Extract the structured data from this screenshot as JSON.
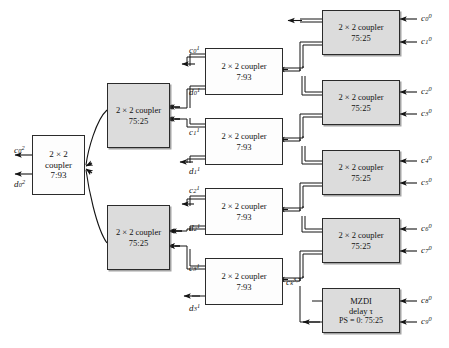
{
  "diagram": {
    "colors": {
      "shaded_fill": "#dcdcdc",
      "plain_fill": "#fdfdfd",
      "stroke": "#2b2b2b",
      "text": "#111111"
    },
    "stage": {
      "width": 449,
      "height": 348
    }
  },
  "blocks": {
    "output_coupler": {
      "name": "output-coupler",
      "line1": "2 × 2",
      "line2": "coupler",
      "line3": "7:93",
      "style": "plain"
    },
    "stage2_couplers": [
      {
        "name": "stage2-coupler-top",
        "line1": "2 × 2 coupler",
        "line2": "75:25",
        "style": "shaded"
      },
      {
        "name": "stage2-coupler-bottom",
        "line1": "2 × 2 coupler",
        "line2": "75:25",
        "style": "shaded"
      }
    ],
    "stage1_couplers": [
      {
        "name": "stage1-coupler-0",
        "line1": "2 × 2 coupler",
        "line2": "7:93",
        "style": "plain"
      },
      {
        "name": "stage1-coupler-1",
        "line1": "2 × 2 coupler",
        "line2": "7:93",
        "style": "plain"
      },
      {
        "name": "stage1-coupler-2",
        "line1": "2 × 2 coupler",
        "line2": "7:93",
        "style": "plain"
      },
      {
        "name": "stage1-coupler-3",
        "line1": "2 × 2 coupler",
        "line2": "7:93",
        "style": "plain"
      }
    ],
    "input_couplers": [
      {
        "name": "input-coupler-0",
        "line1": "2 × 2 coupler",
        "line2": "75:25",
        "style": "shaded"
      },
      {
        "name": "input-coupler-1",
        "line1": "2 × 2 coupler",
        "line2": "75:25",
        "style": "shaded"
      },
      {
        "name": "input-coupler-2",
        "line1": "2 × 2 coupler",
        "line2": "75:25",
        "style": "shaded"
      },
      {
        "name": "input-coupler-3",
        "line1": "2 × 2 coupler",
        "line2": "75:25",
        "style": "shaded"
      }
    ],
    "mzdi": {
      "name": "mzdi-block",
      "line1": "MZDI",
      "line2": "delay τ",
      "line3": "PS = 0: 75:25",
      "style": "shaded"
    }
  },
  "labels": {
    "inputs": [
      {
        "base": "c",
        "sub": "0",
        "sup": "0"
      },
      {
        "base": "c",
        "sub": "1",
        "sup": "0"
      },
      {
        "base": "c",
        "sub": "2",
        "sup": "0"
      },
      {
        "base": "c",
        "sub": "3",
        "sup": "0"
      },
      {
        "base": "c",
        "sub": "4",
        "sup": "0"
      },
      {
        "base": "c",
        "sub": "5",
        "sup": "0"
      },
      {
        "base": "c",
        "sub": "6",
        "sup": "0"
      },
      {
        "base": "c",
        "sub": "7",
        "sup": "0"
      },
      {
        "base": "c",
        "sub": "8",
        "sup": "0"
      },
      {
        "base": "c",
        "sub": "9",
        "sup": "0"
      }
    ],
    "stage1_outputs": [
      {
        "base": "c",
        "sub": "0",
        "sup": "1"
      },
      {
        "base": "d",
        "sub": "0",
        "sup": "1"
      },
      {
        "base": "c",
        "sub": "1",
        "sup": "1"
      },
      {
        "base": "d",
        "sub": "1",
        "sup": "1"
      },
      {
        "base": "c",
        "sub": "2",
        "sup": "1"
      },
      {
        "base": "d",
        "sub": "2",
        "sup": "1"
      },
      {
        "base": "c",
        "sub": "3",
        "sup": "1"
      },
      {
        "base": "d",
        "sub": "3",
        "sup": "1"
      }
    ],
    "final_outputs": [
      {
        "base": "c",
        "sub": "0",
        "sup": "2"
      },
      {
        "base": "d",
        "sub": "0",
        "sup": "2"
      }
    ],
    "mzdi_feed": {
      "base": "c",
      "sub": "k",
      "sup": "3,7"
    }
  }
}
